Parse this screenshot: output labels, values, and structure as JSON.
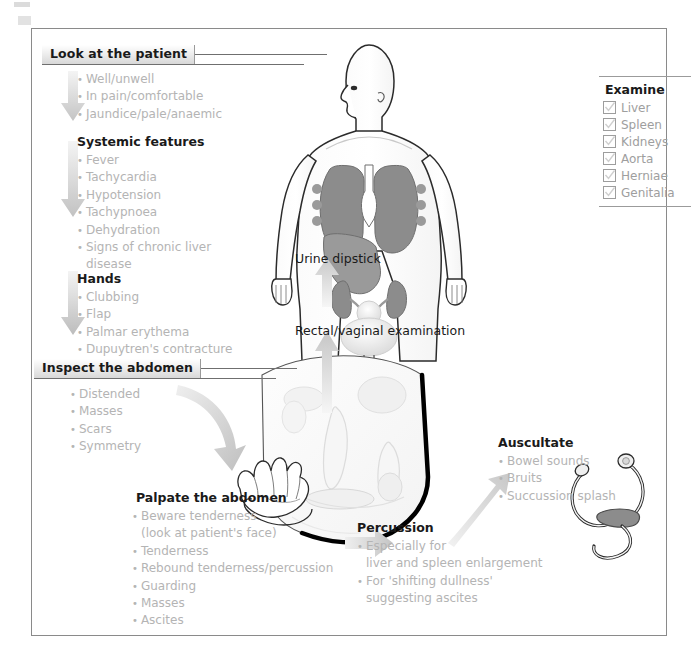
{
  "sections": {
    "look": {
      "heading": "Look at the patient",
      "items": [
        "Well/unwell",
        "In pain/comfortable",
        "Jaundice/pale/anaemic"
      ]
    },
    "systemic": {
      "heading": "Systemic features",
      "items": [
        "Fever",
        "Tachycardia",
        "Hypotension",
        "Tachypnoea",
        "Dehydration",
        "Signs of chronic liver",
        "disease"
      ]
    },
    "hands": {
      "heading": "Hands",
      "items": [
        "Clubbing",
        "Flap",
        "Palmar erythema",
        "Dupuytren's contracture"
      ]
    },
    "inspect": {
      "heading": "Inspect the abdomen",
      "items": [
        "Distended",
        "Masses",
        "Scars",
        "Symmetry"
      ]
    },
    "palpate": {
      "heading": "Palpate the abdomen",
      "items": [
        "Beware tenderness",
        "(look at patient's face)",
        "Tenderness",
        "Rebound tenderness/percussion",
        "Guarding",
        "Masses",
        "Ascites"
      ]
    },
    "percussion": {
      "heading": "Percussion",
      "items": [
        "Especially for",
        "liver and spleen enlargement",
        "For 'shifting dullness'",
        "suggesting ascites"
      ]
    },
    "auscultate": {
      "heading": "Auscultate",
      "items": [
        "Bowel sounds",
        "Bruits",
        "Succussion splash"
      ]
    },
    "examine": {
      "heading": "Examine",
      "items": [
        "Liver",
        "Spleen",
        "Kidneys",
        "Aorta",
        "Herniae",
        "Genitalia"
      ]
    }
  },
  "steps": {
    "urine_dipstick": "Urine dipstick",
    "rectal_vaginal": "Rectal/vaginal examination"
  },
  "colors": {
    "frame": "#8a8a8a",
    "list_text": "#b4b4b4",
    "heading_text": "#1a1a1a",
    "arrow_gray": "#d2d2d2",
    "organ_dark": "#8c8c8c",
    "organ_mid": "#b5b5b5",
    "outline": "#2b2b2b"
  }
}
